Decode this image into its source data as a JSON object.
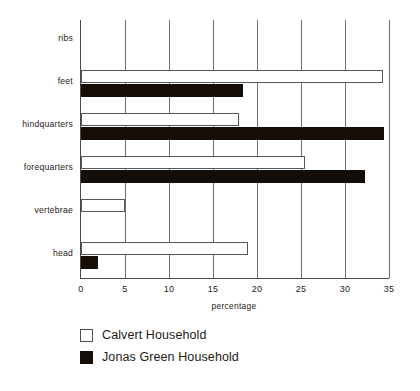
{
  "chart_data": {
    "type": "bar",
    "orientation": "horizontal",
    "title": "",
    "xlabel": "percentage",
    "ylabel": "",
    "xlim": [
      0,
      35
    ],
    "xticks": [
      0,
      5,
      10,
      15,
      20,
      25,
      30,
      35
    ],
    "xtick_labels": [
      "0",
      "5",
      "10",
      "15",
      "20",
      "25",
      "30",
      "35"
    ],
    "grid": "vertical",
    "legend_position": "below-axes-left",
    "categories": [
      "ribs",
      "feet",
      "hindquarters",
      "forequarters",
      "vertebrae",
      "head"
    ],
    "series": [
      {
        "name": "Calvert Household",
        "color": "#ffffff",
        "edge_color": "#575757",
        "values": [
          0,
          34.3,
          18.0,
          25.5,
          5.0,
          19.0
        ]
      },
      {
        "name": "Jonas Green Household",
        "color": "#140d08",
        "edge_color": "#140d08",
        "values": [
          0,
          18.4,
          34.4,
          32.3,
          0,
          1.9
        ]
      }
    ]
  },
  "legend": {
    "entries": [
      {
        "label": "Calvert Household",
        "swatch": "open-square"
      },
      {
        "label": "Jonas Green Household",
        "swatch": "filled-square"
      }
    ]
  }
}
